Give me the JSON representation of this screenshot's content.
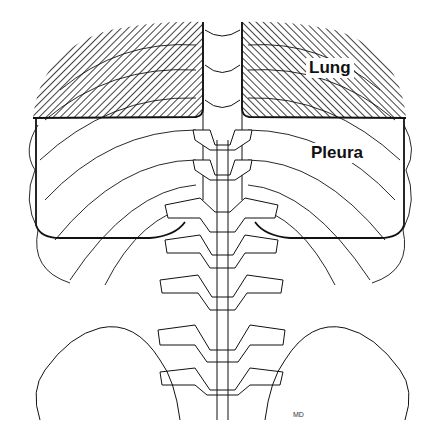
{
  "diagram": {
    "labels": {
      "lung": "Lung",
      "pleura": "Pleura",
      "signature": "MD"
    },
    "regions": [
      {
        "name": "lung",
        "style": "dense diagonal hatching",
        "extent": "upper field above horizontal boundary line"
      },
      {
        "name": "pleura",
        "style": "outlined rectangle below lung boundary extending lower than lung",
        "extent": "middle field"
      }
    ],
    "colors": {
      "line": "#111111",
      "background": "#ffffff"
    }
  }
}
